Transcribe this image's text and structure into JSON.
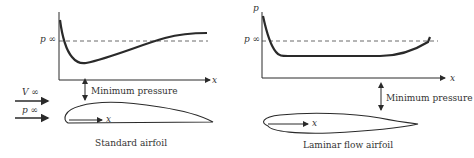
{
  "left_panel": {
    "title": "Standard airfoil",
    "y_axis_label": "",
    "x_axis_label": "x",
    "p_inf_label": "p ∞",
    "annotation": "Minimum pressure",
    "freestream_velocity_label": "V ∞",
    "freestream_pressure_label": "p ∞",
    "airfoil_x_label": "x"
  },
  "right_panel": {
    "title": "Laminar flow airfoil",
    "y_axis_label": "p",
    "x_axis_label": "x",
    "p_inf_label": "p ∞",
    "annotation": "Minimum pressure",
    "airfoil_x_label": "x"
  },
  "colors": {
    "line": "#2a2a2a",
    "background": "#ffffff"
  }
}
